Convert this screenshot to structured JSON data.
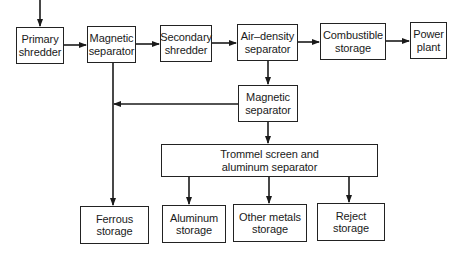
{
  "diagram": {
    "type": "process-flow",
    "nodes": [
      {
        "id": "primary_shredder",
        "label": "Primary\nshredder"
      },
      {
        "id": "magnetic_separator_1",
        "label": "Magnetic\nseparator"
      },
      {
        "id": "secondary_shredder",
        "label": "Secondary\nshredder"
      },
      {
        "id": "air_density_separator",
        "label": "Air–density\nseparator"
      },
      {
        "id": "combustible_storage",
        "label": "Combustible\nstorage"
      },
      {
        "id": "power_plant",
        "label": "Power\nplant"
      },
      {
        "id": "magnetic_separator_2",
        "label": "Magnetic\nseparator"
      },
      {
        "id": "trommel",
        "label": "Trommel screen and\naluminum separator"
      },
      {
        "id": "ferrous_storage",
        "label": "Ferrous\nstorage"
      },
      {
        "id": "aluminum_storage",
        "label": "Aluminum\nstorage"
      },
      {
        "id": "other_metals_storage",
        "label": "Other metals\nstorage"
      },
      {
        "id": "reject_storage",
        "label": "Reject\nstorage"
      }
    ],
    "edges": [
      {
        "from": "input",
        "to": "primary_shredder"
      },
      {
        "from": "primary_shredder",
        "to": "magnetic_separator_1"
      },
      {
        "from": "magnetic_separator_1",
        "to": "secondary_shredder"
      },
      {
        "from": "magnetic_separator_1",
        "to": "ferrous_storage"
      },
      {
        "from": "secondary_shredder",
        "to": "air_density_separator"
      },
      {
        "from": "air_density_separator",
        "to": "combustible_storage"
      },
      {
        "from": "combustible_storage",
        "to": "power_plant"
      },
      {
        "from": "air_density_separator",
        "to": "magnetic_separator_2"
      },
      {
        "from": "magnetic_separator_2",
        "to": "ferrous_storage"
      },
      {
        "from": "magnetic_separator_2",
        "to": "trommel"
      },
      {
        "from": "trommel",
        "to": "aluminum_storage"
      },
      {
        "from": "trommel",
        "to": "other_metals_storage"
      },
      {
        "from": "trommel",
        "to": "reject_storage"
      }
    ]
  }
}
